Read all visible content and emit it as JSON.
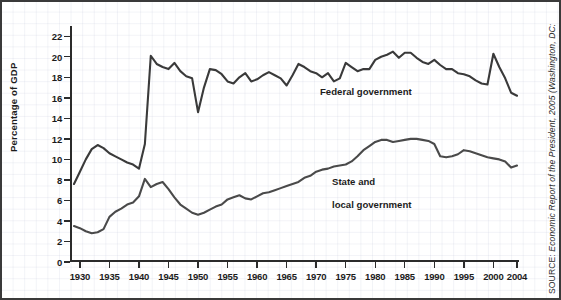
{
  "chart_data": {
    "type": "line",
    "title": "",
    "xlabel": "",
    "ylabel": "Percentage of GDP",
    "xlim": [
      1929,
      2004
    ],
    "ylim": [
      0,
      23
    ],
    "grid": true,
    "legend_position": "inline-annotation",
    "y_ticks": [
      0,
      2,
      4,
      6,
      8,
      10,
      12,
      14,
      16,
      18,
      20,
      22
    ],
    "x_ticks": [
      1930,
      1935,
      1940,
      1945,
      1950,
      1955,
      1960,
      1965,
      1970,
      1975,
      1980,
      1985,
      1990,
      1995,
      2000,
      2004
    ],
    "x": [
      1929,
      1930,
      1931,
      1932,
      1933,
      1934,
      1935,
      1936,
      1937,
      1938,
      1939,
      1940,
      1941,
      1942,
      1943,
      1944,
      1945,
      1946,
      1947,
      1948,
      1949,
      1950,
      1951,
      1952,
      1953,
      1954,
      1955,
      1956,
      1957,
      1958,
      1959,
      1960,
      1961,
      1962,
      1963,
      1964,
      1965,
      1966,
      1967,
      1968,
      1969,
      1970,
      1971,
      1972,
      1973,
      1974,
      1975,
      1976,
      1977,
      1978,
      1979,
      1980,
      1981,
      1982,
      1983,
      1984,
      1985,
      1986,
      1987,
      1988,
      1989,
      1990,
      1991,
      1992,
      1993,
      1994,
      1995,
      1996,
      1997,
      1998,
      1999,
      2000,
      2001,
      2002,
      2003,
      2004
    ],
    "series": [
      {
        "name": "Federal government",
        "color": "#3a3a3a",
        "values": [
          7.6,
          8.8,
          10.0,
          11.0,
          11.4,
          11.1,
          10.6,
          10.3,
          10.0,
          9.7,
          9.5,
          9.1,
          11.5,
          20.1,
          19.3,
          19.0,
          18.8,
          19.4,
          18.6,
          18.1,
          17.9,
          14.6,
          17.0,
          18.8,
          18.7,
          18.3,
          17.6,
          17.4,
          18.0,
          18.4,
          17.6,
          17.8,
          18.2,
          18.5,
          18.2,
          17.9,
          17.2,
          18.2,
          19.3,
          19.0,
          18.6,
          18.4,
          18.0,
          18.4,
          17.6,
          17.9,
          19.4,
          19.0,
          18.6,
          18.8,
          18.8,
          19.7,
          20.0,
          20.2,
          20.5,
          19.9,
          20.4,
          20.4,
          19.9,
          19.5,
          19.3,
          19.7,
          19.2,
          18.8,
          18.8,
          18.4,
          18.3,
          18.1,
          17.7,
          17.4,
          17.3,
          20.3,
          19.0,
          17.9,
          16.5,
          16.2
        ]
      },
      {
        "name": "State and local government",
        "color": "#4a4a4a",
        "values": [
          3.5,
          3.3,
          3.0,
          2.8,
          2.9,
          3.2,
          4.4,
          4.9,
          5.2,
          5.6,
          5.8,
          6.4,
          8.1,
          7.3,
          7.6,
          7.8,
          7.1,
          6.3,
          5.6,
          5.2,
          4.8,
          4.6,
          4.8,
          5.1,
          5.4,
          5.6,
          6.1,
          6.3,
          6.5,
          6.2,
          6.1,
          6.4,
          6.7,
          6.8,
          7.0,
          7.2,
          7.4,
          7.6,
          7.8,
          8.2,
          8.4,
          8.8,
          9.0,
          9.1,
          9.3,
          9.4,
          9.5,
          9.8,
          10.3,
          10.9,
          11.3,
          11.7,
          11.9,
          11.9,
          11.7,
          11.8,
          11.9,
          12.0,
          12.0,
          11.9,
          11.8,
          11.5,
          10.3,
          10.2,
          10.3,
          10.5,
          10.9,
          10.8,
          10.6,
          10.4,
          10.2,
          10.1,
          10.0,
          9.8,
          9.2,
          9.4
        ]
      }
    ],
    "annotations": [
      {
        "text": "Federal government",
        "x": 1968,
        "y": 16.5
      },
      {
        "text": "State and\nlocal government",
        "x": 1972,
        "y": 9.9
      }
    ]
  },
  "figure": {
    "y_axis_title": "Percentage of GDP",
    "y_tick_labels": [
      "22",
      "20",
      "18",
      "16",
      "14",
      "12",
      "10",
      "8",
      "6",
      "4",
      "2",
      "0"
    ],
    "x_tick_labels": [
      "1930",
      "1935",
      "1940",
      "1945",
      "1950",
      "1955",
      "1960",
      "1965",
      "1970",
      "1975",
      "1980",
      "1985",
      "1990",
      "1995",
      "2000",
      "2004"
    ],
    "label_federal": "Federal government",
    "label_state_line1": "State and",
    "label_state_line2": "local government",
    "source_prefix": "SOURCE:",
    "source_text": " Economic Report of the President, 2005 (Washington, DC:"
  }
}
